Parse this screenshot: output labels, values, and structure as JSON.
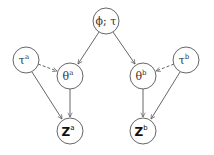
{
  "diagram": {
    "type": "graphical-model",
    "nodes": {
      "root": {
        "label": "ϕ; τ",
        "cx": 106,
        "cy": 21
      },
      "tau_a": {
        "base": "τ",
        "sup": "a",
        "cx": 26,
        "cy": 60
      },
      "theta_a": {
        "base": "θ",
        "sup": "a",
        "cx": 70,
        "cy": 76
      },
      "theta_b": {
        "base": "θ",
        "sup": "b",
        "cx": 143,
        "cy": 76
      },
      "tau_b": {
        "base": "τ",
        "sup": "b",
        "cx": 186,
        "cy": 60
      },
      "z_a": {
        "base": "Z",
        "sup": "a",
        "cx": 70,
        "cy": 131
      },
      "z_b": {
        "base": "Z",
        "sup": "b",
        "cx": 143,
        "cy": 131
      }
    },
    "edges": [
      {
        "from": "root",
        "to": "theta_a",
        "style": "solid"
      },
      {
        "from": "root",
        "to": "theta_b",
        "style": "solid"
      },
      {
        "from": "tau_a",
        "to": "theta_a",
        "style": "dashed"
      },
      {
        "from": "tau_b",
        "to": "theta_b",
        "style": "dashed"
      },
      {
        "from": "theta_a",
        "to": "z_a",
        "style": "solid"
      },
      {
        "from": "tau_a",
        "to": "z_a",
        "style": "solid"
      },
      {
        "from": "theta_b",
        "to": "z_b",
        "style": "solid"
      },
      {
        "from": "tau_b",
        "to": "z_b",
        "style": "solid"
      }
    ]
  }
}
